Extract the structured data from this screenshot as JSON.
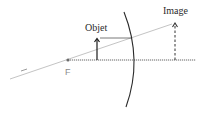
{
  "diagram": {
    "type": "optics-ray-diagram",
    "labels": {
      "object": "Objet",
      "image": "Image",
      "focal_point": "F",
      "ray_mark": "–"
    },
    "colors": {
      "axis": "#555555",
      "mirror": "#2a2a2a",
      "object_arrow": "#1a1a1a",
      "image_arrow": "#333333",
      "ray": "#bbbbbb",
      "horizontal_ray": "#444444",
      "focal_dot": "#666666",
      "text": "#2a2a2a",
      "focal_text": "#8a8a8a"
    },
    "elements": {
      "optical_axis": {
        "x1": 68,
        "y1": 60,
        "x2": 196,
        "y2": 60,
        "style": "dotted"
      },
      "focal_point": {
        "x": 68,
        "y": 60
      },
      "object_arrow": {
        "x": 97,
        "y_base": 60,
        "y_tip": 38
      },
      "image_arrow": {
        "x": 175,
        "y_base": 60,
        "y_tip": 22,
        "style": "dashed"
      },
      "mirror_arc": {
        "top": [
          124,
          12
        ],
        "apex": [
          134,
          60
        ],
        "bottom": [
          126,
          107
        ]
      },
      "ray_through_focus": {
        "x1": 10,
        "y1": 79,
        "x2": 172,
        "y2": 24
      },
      "horizontal_ray": {
        "x1": 100,
        "y1": 38,
        "x2": 132,
        "y2": 38
      }
    }
  }
}
